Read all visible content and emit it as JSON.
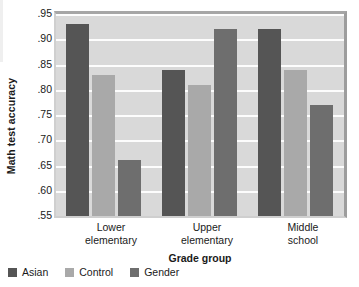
{
  "chart_data": {
    "type": "bar",
    "title": "",
    "xlabel": "Grade group",
    "ylabel": "Math test accuracy",
    "categories": [
      "Lower elementary",
      "Upper elementary",
      "Middle school"
    ],
    "category_lines": [
      [
        "Lower",
        "elementary"
      ],
      [
        "Upper",
        "elementary"
      ],
      [
        "Middle",
        "school"
      ]
    ],
    "series": [
      {
        "name": "Asian",
        "color": "#555555",
        "values": [
          0.93,
          0.84,
          0.92
        ]
      },
      {
        "name": "Control",
        "color": "#a9a9a9",
        "values": [
          0.83,
          0.81,
          0.84
        ]
      },
      {
        "name": "Gender",
        "color": "#6e6e6e",
        "values": [
          0.66,
          0.92,
          0.77
        ]
      }
    ],
    "ylim": [
      0.55,
      0.95
    ],
    "yticks": [
      0.95,
      0.9,
      0.85,
      0.8,
      0.75,
      0.7,
      0.65,
      0.6,
      0.55
    ],
    "ytick_labels": [
      ".95",
      ".90",
      ".85",
      ".80",
      ".75",
      ".70",
      ".65",
      ".60",
      ".55"
    ],
    "grid": true,
    "legend_position": "bottom-left",
    "plot_background": "#d9d9d9",
    "gridline_color": "#fdfdfd"
  },
  "legend": {
    "items": [
      {
        "label": "Asian"
      },
      {
        "label": "Control"
      },
      {
        "label": "Gender"
      }
    ]
  }
}
